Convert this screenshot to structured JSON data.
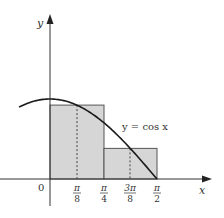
{
  "diagram": {
    "function_label": "y = cos x",
    "axes": {
      "x_label": "x",
      "y_label": "y",
      "origin_label": "0"
    },
    "ticks": [
      {
        "id": "pi8",
        "num": "π",
        "den": "8",
        "value": 0.3927
      },
      {
        "id": "pi4",
        "num": "π",
        "den": "4",
        "value": 0.7854
      },
      {
        "id": "3pi8",
        "num": "3π",
        "den": "8",
        "value": 1.1781
      },
      {
        "id": "pi2",
        "num": "π",
        "den": "2",
        "value": 1.5708
      }
    ],
    "rectangles": [
      {
        "x_start": 0,
        "x_end": 0.7854,
        "midpoint": 0.3927,
        "height": 0.9239
      },
      {
        "x_start": 0.7854,
        "x_end": 1.5708,
        "midpoint": 1.1781,
        "height": 0.3827
      }
    ],
    "colors": {
      "fill": "#d6d6d6",
      "stroke": "#333333",
      "curve": "#1a1a1a"
    }
  }
}
